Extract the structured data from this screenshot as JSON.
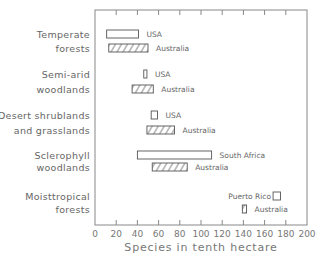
{
  "chart_data": {
    "type": "bar",
    "subtype": "horizontal floating range bars",
    "title": "",
    "xlabel": "Species in tenth hectare",
    "ylabel": "",
    "xlim": [
      0,
      200
    ],
    "xticks": [
      0,
      20,
      40,
      60,
      80,
      100,
      120,
      140,
      160,
      180,
      200
    ],
    "grid": false,
    "legend": "inline labels next to bars",
    "categories": [
      {
        "name": "Temperate forests",
        "lines": [
          "Temperate",
          "forests"
        ]
      },
      {
        "name": "Semi-arid woodlands",
        "lines": [
          "Semi-arid",
          "woodlands"
        ]
      },
      {
        "name": "Desert shrublands and grasslands",
        "lines": [
          "Desert shrublands",
          "and grasslands"
        ]
      },
      {
        "name": "Sclerophyll woodlands",
        "lines": [
          "Sclerophyll",
          "woodlands"
        ]
      },
      {
        "name": "Moist tropical forests",
        "lines": [
          "Moisttropical",
          "forests"
        ]
      }
    ],
    "bars": [
      {
        "category": "Temperate forests",
        "region": "USA",
        "min": 11,
        "max": 41,
        "hatched": false,
        "y": 34,
        "label_side": "right"
      },
      {
        "category": "Temperate forests",
        "region": "Australia",
        "min": 13,
        "max": 50,
        "hatched": true,
        "y": 48,
        "label_side": "right"
      },
      {
        "category": "Semi-arid woodlands",
        "region": "USA",
        "min": 46,
        "max": 49,
        "hatched": false,
        "y": 74,
        "label_side": "right"
      },
      {
        "category": "Semi-arid woodlands",
        "region": "Australia",
        "min": 35,
        "max": 55,
        "hatched": true,
        "y": 89,
        "label_side": "right"
      },
      {
        "category": "Desert shrublands and grasslands",
        "region": "USA",
        "min": 53,
        "max": 59,
        "hatched": false,
        "y": 115,
        "label_side": "right"
      },
      {
        "category": "Desert shrublands and grasslands",
        "region": "Australia",
        "min": 49,
        "max": 75,
        "hatched": true,
        "y": 130,
        "label_side": "right"
      },
      {
        "category": "Sclerophyll woodlands",
        "region": "South Africa",
        "min": 40,
        "max": 110,
        "hatched": false,
        "y": 155,
        "label_side": "right"
      },
      {
        "category": "Sclerophyll woodlands",
        "region": "Australia",
        "min": 54,
        "max": 87,
        "hatched": true,
        "y": 167,
        "label_side": "right"
      },
      {
        "category": "Moist tropical forests",
        "region": "Puerto Rico",
        "min": 168,
        "max": 175,
        "hatched": false,
        "y": 196,
        "label_side": "left"
      },
      {
        "category": "Moist tropical forests",
        "region": "Australia",
        "min": 139,
        "max": 143,
        "hatched": true,
        "y": 209,
        "label_side": "right"
      }
    ],
    "category_label_y": [
      [
        34,
        48
      ],
      [
        74,
        89
      ],
      [
        115,
        130
      ],
      [
        155,
        167
      ],
      [
        196,
        209
      ]
    ]
  },
  "colors": {
    "frame": "#888888",
    "bar_stroke": "#555555",
    "text": "#666666"
  }
}
